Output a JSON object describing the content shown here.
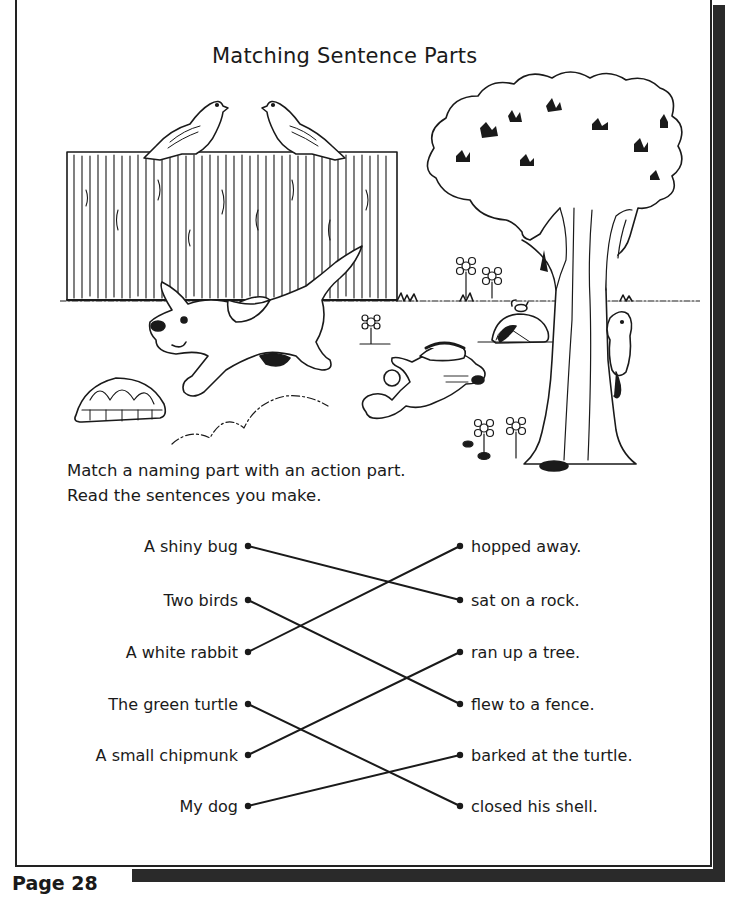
{
  "worksheet": {
    "title": "Matching Sentence Parts",
    "instructions": [
      "Match a naming part with an action part.",
      "Read the sentences you make."
    ],
    "naming_parts": [
      "A shiny bug",
      "Two birds",
      "A white rabbit",
      "The green turtle",
      "A small chipmunk",
      "My dog"
    ],
    "action_parts": [
      "hopped away.",
      "sat on a rock.",
      "ran up a tree.",
      "flew to a fence.",
      "barked at the turtle.",
      "closed his shell."
    ],
    "matches": [
      {
        "naming": "A shiny bug",
        "action": "sat on a rock."
      },
      {
        "naming": "Two birds",
        "action": "flew to a fence."
      },
      {
        "naming": "A white rabbit",
        "action": "hopped away."
      },
      {
        "naming": "The green turtle",
        "action": "closed his shell."
      },
      {
        "naming": "A small chipmunk",
        "action": "ran up a tree."
      },
      {
        "naming": "My dog",
        "action": "barked at the turtle."
      }
    ],
    "illustration": {
      "elements": [
        "two-birds-on-fence",
        "wooden-fence",
        "running-dog",
        "turtle-shell",
        "hopping-rabbit",
        "tree",
        "chipmunk-on-tree",
        "bug-on-rock",
        "flowers",
        "grass"
      ]
    },
    "page_label": "Page 28"
  },
  "colors": {
    "ink": "#1a1a1a",
    "shadow": "#2a2a2a",
    "paper": "#ffffff"
  }
}
